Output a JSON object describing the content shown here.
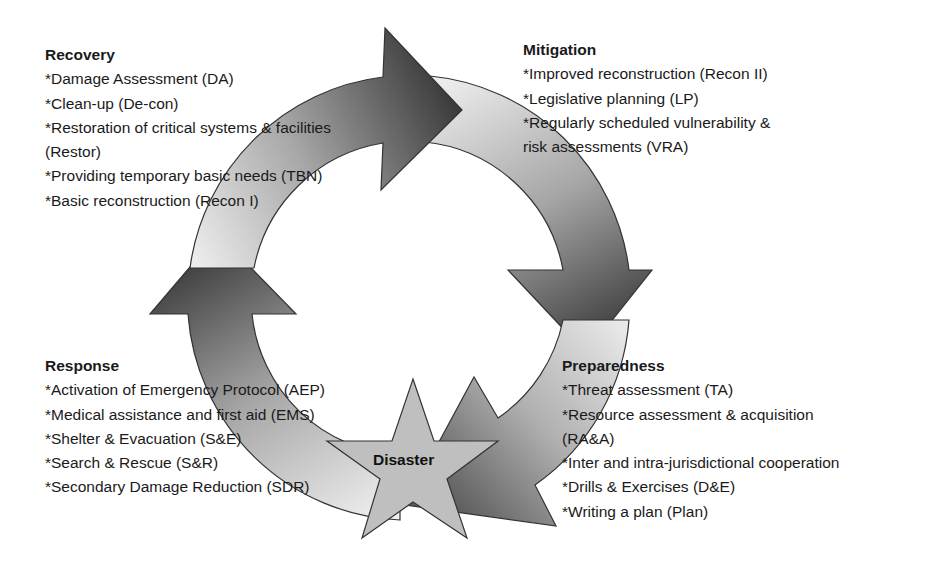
{
  "center": {
    "label": "Disaster"
  },
  "colors": {
    "arrow_light": "#e6e6e6",
    "arrow_dark": "#3c3c3c",
    "star_fill": "#bdbdbd",
    "outline": "#333333",
    "text": "#1a1a1a"
  },
  "phases": {
    "recovery": {
      "title": "Recovery",
      "items": [
        "*Damage Assessment (DA)",
        "*Clean-up (De-con)",
        "*Restoration of critical systems & facilities",
        "(Restor)",
        "*Providing temporary basic needs (TBN)",
        "*Basic reconstruction (Recon I)"
      ]
    },
    "mitigation": {
      "title": "Mitigation",
      "items": [
        "*Improved reconstruction (Recon II)",
        "*Legislative planning (LP)",
        "*Regularly scheduled vulnerability &",
        "risk assessments (VRA)"
      ]
    },
    "response": {
      "title": "Response",
      "items": [
        "*Activation of Emergency Protocol (AEP)",
        "*Medical assistance and first aid (EMS)",
        "*Shelter & Evacuation (S&E)",
        "*Search & Rescue (S&R)",
        "*Secondary Damage Reduction (SDR)"
      ]
    },
    "preparedness": {
      "title": "Preparedness",
      "items": [
        "*Threat assessment (TA)",
        "*Resource assessment & acquisition",
        "(RA&A)",
        "*Inter and intra-jurisdictional cooperation",
        "*Drills & Exercises (D&E)",
        "*Writing a plan (Plan)"
      ]
    }
  }
}
